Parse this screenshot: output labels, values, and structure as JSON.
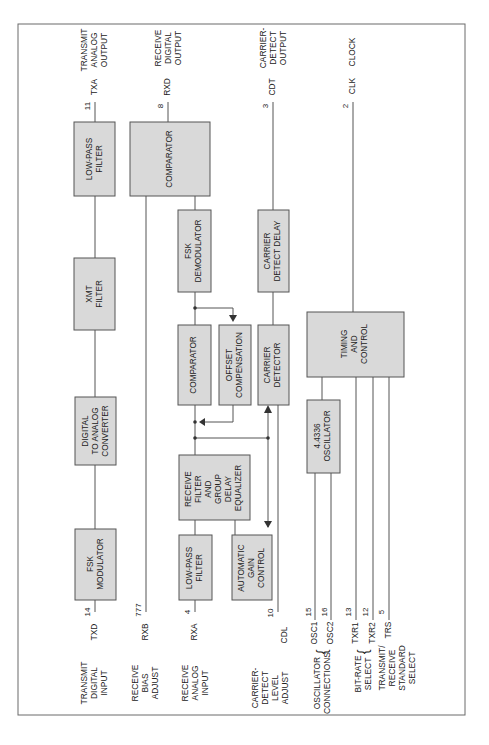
{
  "diagram": {
    "orientation": "rotated-90-ccw",
    "colors": {
      "block_fill": "#d9d9d9",
      "block_border": "#555555",
      "line": "#555555",
      "frame": "#6a6a6a"
    },
    "blocks": {
      "fsk_modulator": [
        "FSK",
        "MODULATOR"
      ],
      "dac": [
        "DIGITAL",
        "TO ANALOG",
        "CONVERTER"
      ],
      "xmt_filter": [
        "XMT",
        "FILTER"
      ],
      "tx_lowpass": [
        "LOW-PASS",
        "FILTER"
      ],
      "rx_lowpass": [
        "LOW-PASS",
        "FILTER"
      ],
      "rx_filter": [
        "RECEIVE",
        "FILTER",
        "AND",
        "GROUP",
        "DELAY",
        "EQUALIZER"
      ],
      "agc": [
        "AUTOMATIC",
        "GAIN",
        "CONTROL"
      ],
      "comparator1": [
        "COMPARATOR"
      ],
      "offset_comp": [
        "OFFSET",
        "COMPENSATION"
      ],
      "fsk_demod": [
        "FSK",
        "DEMODULATOR"
      ],
      "comparator2": [
        "COMPARATOR"
      ],
      "carrier_detector": [
        "CARRIER",
        "DETECTOR"
      ],
      "carrier_delay": [
        "CARRIER",
        "DETECT DELAY"
      ],
      "oscillator": [
        "4.4336",
        "OSCILLATOR"
      ],
      "timing": [
        "TIMING",
        "AND",
        "CONTROL"
      ]
    },
    "inputs": [
      {
        "desc": [
          "TRANSMIT",
          "DIGITAL",
          "INPUT"
        ],
        "signal": "TXD",
        "pin": "14"
      },
      {
        "desc": [
          "RECEIVE",
          "BIAS",
          "ADJUST"
        ],
        "signal": "RXB",
        "pin": "777"
      },
      {
        "desc": [
          "RECEIVE",
          "ANALOG",
          "INPUT"
        ],
        "signal": "RXA",
        "pin": "4"
      },
      {
        "desc": [
          "CARRIER-",
          "DETECT",
          "LEVEL",
          "ADJUST"
        ],
        "signal": "CDL",
        "pin": "10"
      },
      {
        "desc": [
          "OSCILLATOR",
          "CONNECTIONS"
        ],
        "signal": "OSC1",
        "pin": "15"
      },
      {
        "desc": [],
        "signal": "OSC2",
        "pin": "16"
      },
      {
        "desc": [
          "BIT-RATE",
          "SELECT"
        ],
        "signal": "TXR1",
        "pin": "13"
      },
      {
        "desc": [],
        "signal": "TXR2",
        "pin": "12"
      },
      {
        "desc": [
          "TRANSMIT/",
          "RECEIVE",
          "STANDARD",
          "SELECT"
        ],
        "signal": "TRS",
        "pin": "5"
      }
    ],
    "outputs": [
      {
        "desc": [
          "TRANSMIT",
          "ANALOG",
          "OUTPUT"
        ],
        "signal": "TXA",
        "pin": "11"
      },
      {
        "desc": [
          "RECEIVE",
          "DIGITAL",
          "OUTPUT"
        ],
        "signal": "RXD",
        "pin": "8"
      },
      {
        "desc": [
          "CARRIER-",
          "DETECT",
          "OUTPUT"
        ],
        "signal": "CDT",
        "pin": "3"
      },
      {
        "desc": [
          "CLOCK"
        ],
        "signal": "CLK",
        "pin": "2"
      }
    ]
  }
}
